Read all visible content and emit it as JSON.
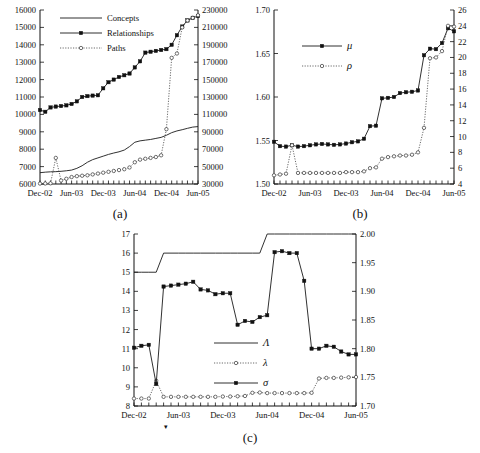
{
  "figure": {
    "x_tick_labels": [
      "Dec-02",
      "Jun-03",
      "Dec-03",
      "Jun-04",
      "Dec-04",
      "Jun-05"
    ],
    "n_points": 31,
    "colors": {
      "line": "#1a1a1a",
      "dotted": "#444444",
      "marker_fill": "#111111",
      "background": "#ffffff"
    }
  },
  "panels": {
    "a": {
      "caption": "(a)"
    },
    "b": {
      "caption": "(b)"
    },
    "c": {
      "caption": "(c)"
    }
  },
  "chart_data": [
    {
      "id": "a",
      "type": "line",
      "title": "",
      "caption": "(a)",
      "xlabel": "",
      "ylabel": "",
      "grid": false,
      "legend_position": "top-center",
      "x": [
        "Dec-02",
        "Jan-03",
        "Feb-03",
        "Mar-03",
        "Apr-03",
        "May-03",
        "Jun-03",
        "Jul-03",
        "Aug-03",
        "Sep-03",
        "Oct-03",
        "Nov-03",
        "Dec-03",
        "Jan-04",
        "Feb-04",
        "Mar-04",
        "Apr-04",
        "May-04",
        "Jun-04",
        "Jul-04",
        "Aug-04",
        "Sep-04",
        "Oct-04",
        "Nov-04",
        "Dec-04",
        "Jan-05",
        "Feb-05",
        "Mar-05",
        "Apr-05",
        "May-05",
        "Jun-05"
      ],
      "x_tick_labels": [
        "Dec-02",
        "Jun-03",
        "Dec-03",
        "Jun-04",
        "Dec-04",
        "Jun-05"
      ],
      "axes": {
        "left": {
          "label": "",
          "ylim": [
            6000,
            16000
          ],
          "ticks": [
            6000,
            7000,
            8000,
            9000,
            10000,
            11000,
            12000,
            13000,
            14000,
            15000,
            16000
          ]
        },
        "right": {
          "label": "",
          "ylim": [
            30000,
            230000
          ],
          "ticks": [
            30000,
            50000,
            70000,
            90000,
            110000,
            130000,
            150000,
            170000,
            190000,
            210000,
            230000
          ]
        }
      },
      "series": [
        {
          "name": "Concepts",
          "axis": "left",
          "style": "solid",
          "marker": "none",
          "values": [
            6650,
            6680,
            6700,
            6710,
            6730,
            6760,
            6800,
            6900,
            7050,
            7250,
            7400,
            7500,
            7600,
            7700,
            7780,
            7850,
            7950,
            8150,
            8400,
            8480,
            8520,
            8560,
            8620,
            8680,
            8800,
            8950,
            9050,
            9120,
            9200,
            9270,
            9300
          ]
        },
        {
          "name": "Relationships",
          "axis": "left",
          "style": "solid",
          "marker": "square",
          "values": [
            10250,
            10150,
            10400,
            10450,
            10480,
            10520,
            10600,
            10750,
            11000,
            11050,
            11080,
            11100,
            11500,
            11850,
            12000,
            12150,
            12250,
            12350,
            12700,
            13050,
            13550,
            13600,
            13650,
            13700,
            13750,
            14000,
            14550,
            15050,
            15400,
            15550,
            15650
          ]
        },
        {
          "name": "Paths",
          "axis": "right",
          "style": "dotted",
          "marker": "circle",
          "values": [
            30500,
            30600,
            30800,
            60000,
            34000,
            36000,
            38000,
            39000,
            39500,
            40000,
            41000,
            42000,
            43000,
            44000,
            45000,
            46000,
            47000,
            49000,
            55000,
            58000,
            59000,
            60000,
            61000,
            63000,
            93000,
            175000,
            180000,
            210000,
            218000,
            221000,
            224000
          ]
        }
      ]
    },
    {
      "id": "b",
      "type": "line",
      "title": "",
      "caption": "(b)",
      "xlabel": "",
      "ylabel": "",
      "grid": false,
      "legend_position": "top-center",
      "x": [
        "Dec-02",
        "Jan-03",
        "Feb-03",
        "Mar-03",
        "Apr-03",
        "May-03",
        "Jun-03",
        "Jul-03",
        "Aug-03",
        "Sep-03",
        "Oct-03",
        "Nov-03",
        "Dec-03",
        "Jan-04",
        "Feb-04",
        "Mar-04",
        "Apr-04",
        "May-04",
        "Jun-04",
        "Jul-04",
        "Aug-04",
        "Sep-04",
        "Oct-04",
        "Nov-04",
        "Dec-04",
        "Jan-05",
        "Feb-05",
        "Mar-05",
        "Apr-05",
        "May-05",
        "Jun-05"
      ],
      "x_tick_labels": [
        "Dec-02",
        "Jun-03",
        "Dec-03",
        "Jun-04",
        "Dec-04",
        "Jun-05"
      ],
      "axes": {
        "left": {
          "label": "μ",
          "ylim": [
            1.5,
            1.7
          ],
          "ticks": [
            1.5,
            1.55,
            1.6,
            1.65,
            1.7
          ]
        },
        "right": {
          "label": "ρ",
          "ylim": [
            4,
            26
          ],
          "ticks": [
            4,
            6,
            8,
            10,
            12,
            14,
            16,
            18,
            20,
            22,
            24,
            26
          ]
        }
      },
      "series": [
        {
          "name": "μ",
          "axis": "left",
          "style": "solid",
          "marker": "square",
          "values": [
            1.5485,
            1.5435,
            1.543,
            1.5445,
            1.543,
            1.5435,
            1.5445,
            1.5455,
            1.546,
            1.5455,
            1.545,
            1.5455,
            1.5465,
            1.548,
            1.549,
            1.552,
            1.5665,
            1.567,
            1.5985,
            1.599,
            1.6,
            1.6045,
            1.6055,
            1.606,
            1.6075,
            1.648,
            1.6555,
            1.655,
            1.662,
            1.679,
            1.6755
          ]
        },
        {
          "name": "ρ",
          "axis": "right",
          "style": "dotted",
          "marker": "circle",
          "values": [
            5.1,
            5.2,
            5.3,
            8.9,
            5.4,
            5.4,
            5.4,
            5.4,
            5.4,
            5.4,
            5.4,
            5.4,
            5.5,
            5.5,
            5.5,
            5.6,
            6.0,
            6.1,
            7.2,
            7.4,
            7.5,
            7.6,
            7.6,
            7.7,
            8.0,
            11.1,
            19.9,
            20.0,
            20.8,
            24.0,
            23.9
          ]
        }
      ]
    },
    {
      "id": "c",
      "type": "line",
      "title": "",
      "caption": "(c)",
      "xlabel": "",
      "ylabel": "",
      "grid": false,
      "legend_position": "center",
      "x": [
        "Dec-02",
        "Jan-03",
        "Feb-03",
        "Mar-03",
        "Apr-03",
        "May-03",
        "Jun-03",
        "Jul-03",
        "Aug-03",
        "Sep-03",
        "Oct-03",
        "Nov-03",
        "Dec-03",
        "Jan-04",
        "Feb-04",
        "Mar-04",
        "Apr-04",
        "May-04",
        "Jun-04",
        "Jul-04",
        "Aug-04",
        "Sep-04",
        "Oct-04",
        "Nov-04",
        "Dec-04",
        "Jan-05",
        "Feb-05",
        "Mar-05",
        "Apr-05",
        "May-05",
        "Jun-05"
      ],
      "x_tick_labels": [
        "Dec-02",
        "Jun-03",
        "Dec-03",
        "Jun-04",
        "Dec-04",
        "Jun-05"
      ],
      "axes": {
        "left": {
          "label": "",
          "ylim": [
            8,
            17
          ],
          "ticks": [
            8,
            9,
            10,
            11,
            12,
            13,
            14,
            15,
            16,
            17
          ]
        },
        "right": {
          "label": "",
          "ylim": [
            1.7,
            2.0
          ],
          "ticks": [
            1.7,
            1.75,
            1.8,
            1.85,
            1.9,
            1.95,
            2.0
          ]
        }
      },
      "series": [
        {
          "name": "Λ",
          "axis": "left",
          "style": "solid",
          "marker": "none",
          "values": [
            15,
            15,
            15,
            15,
            16,
            16,
            16,
            16,
            16,
            16,
            16,
            16,
            16,
            16,
            16,
            16,
            16,
            16,
            17,
            17,
            17,
            17,
            17,
            17,
            17,
            17,
            17,
            17,
            17,
            17,
            17
          ]
        },
        {
          "name": "λ",
          "axis": "right",
          "style": "dotted",
          "marker": "circle",
          "values": [
            1.713,
            1.713,
            1.713,
            1.744,
            1.716,
            1.716,
            1.716,
            1.716,
            1.716,
            1.716,
            1.716,
            1.716,
            1.7165,
            1.7165,
            1.717,
            1.7175,
            1.723,
            1.7235,
            1.7225,
            1.7225,
            1.7225,
            1.7225,
            1.7225,
            1.7225,
            1.723,
            1.748,
            1.749,
            1.749,
            1.7495,
            1.75,
            1.7505
          ]
        },
        {
          "name": "σ",
          "axis": "left",
          "style": "solid",
          "marker": "square",
          "values": [
            11.05,
            11.15,
            11.2,
            9.15,
            14.25,
            14.3,
            14.35,
            14.4,
            14.5,
            14.1,
            14.05,
            13.85,
            13.9,
            13.9,
            12.25,
            12.45,
            12.4,
            12.65,
            12.75,
            16.05,
            16.1,
            16.0,
            16.0,
            14.55,
            11.0,
            11.0,
            11.15,
            11.1,
            10.85,
            10.7,
            10.7
          ]
        }
      ]
    }
  ],
  "legends": {
    "a": [
      {
        "label": "Concepts",
        "style": "solid",
        "marker": "none"
      },
      {
        "label": "Relationships",
        "style": "solid",
        "marker": "square"
      },
      {
        "label": "Paths",
        "style": "dotted",
        "marker": "circle"
      }
    ],
    "b": [
      {
        "label": "μ",
        "style": "solid",
        "marker": "square"
      },
      {
        "label": "ρ",
        "style": "dotted",
        "marker": "circle"
      }
    ],
    "c": [
      {
        "label": "Λ",
        "style": "solid",
        "marker": "none"
      },
      {
        "label": "λ",
        "style": "dotted",
        "marker": "circle"
      },
      {
        "label": "σ",
        "style": "solid",
        "marker": "square"
      }
    ]
  }
}
